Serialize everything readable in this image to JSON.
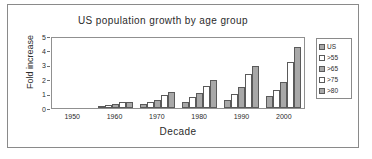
{
  "chart_data": {
    "type": "bar",
    "title": "US population growth by age group",
    "xlabel": "Decade",
    "ylabel": "Fold increase",
    "categories": [
      "1950",
      "1960",
      "1970",
      "1980",
      "1990",
      "2000"
    ],
    "ylim": [
      0,
      5
    ],
    "yticks": [
      "0",
      "1",
      "2",
      "3",
      "4",
      "5"
    ],
    "grid": false,
    "legend_position": "right",
    "series": [
      {
        "name": "US",
        "fill": "grey",
        "values": [
          0,
          0.15,
          0.27,
          0.45,
          0.57,
          0.83
        ]
      },
      {
        "name": ">55",
        "fill": "white",
        "values": [
          0,
          0.22,
          0.42,
          0.78,
          0.95,
          1.22
        ]
      },
      {
        "name": ">65",
        "fill": "grey",
        "values": [
          0,
          0.3,
          0.58,
          1.03,
          1.45,
          1.78
        ]
      },
      {
        "name": ">75",
        "fill": "white",
        "values": [
          0,
          0.4,
          0.93,
          1.55,
          2.33,
          3.17
        ]
      },
      {
        "name": ">80",
        "fill": "grey",
        "values": [
          0,
          0.42,
          1.12,
          1.93,
          2.95,
          4.22
        ]
      }
    ]
  },
  "legend": {
    "items": [
      {
        "label": "US",
        "fill": "grey"
      },
      {
        "label": ">55",
        "fill": "white"
      },
      {
        "label": ">65",
        "fill": "grey"
      },
      {
        "label": ">75",
        "fill": "white"
      },
      {
        "label": ">80",
        "fill": "grey"
      }
    ]
  },
  "colors": {
    "bar_grey": "#a8a8a8",
    "bar_white": "#ffffff",
    "bar_outline": "#5a5a5a",
    "frame": "#8a8a8a",
    "text": "#2b2b2b"
  }
}
